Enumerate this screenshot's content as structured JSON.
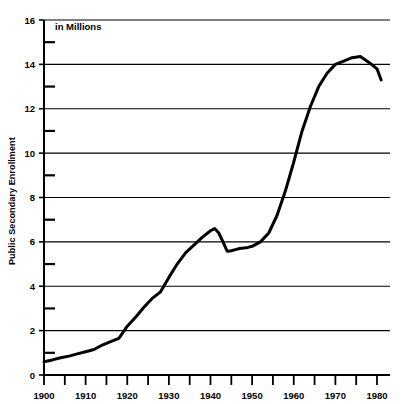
{
  "chart_data": {
    "type": "line",
    "title": "",
    "subtitle": "",
    "annotation": "in Millions",
    "xlabel": "",
    "ylabel": "Public Secondary Enrollment",
    "xlim": [
      1900,
      1981
    ],
    "ylim": [
      0,
      16
    ],
    "ytick_step": 2,
    "yminor_step": 1,
    "xtick_step": 10,
    "xminor_step": 5,
    "grid": "horizontal",
    "legend": "none",
    "line_color": "#000000",
    "line_width": 3,
    "axis_color": "#000000",
    "grid_color": "#000000",
    "background": "#ffffff",
    "xticklabels": [
      "1900",
      "1910",
      "1920",
      "1930",
      "1940",
      "1950",
      "1960",
      "1970",
      "1980"
    ],
    "yticklabels": [
      "0",
      "2",
      "4",
      "6",
      "8",
      "10",
      "12",
      "14",
      "16"
    ],
    "x": [
      1900,
      1902,
      1904,
      1906,
      1908,
      1910,
      1912,
      1914,
      1916,
      1918,
      1920,
      1922,
      1924,
      1926,
      1928,
      1930,
      1932,
      1934,
      1936,
      1938,
      1940,
      1941,
      1942,
      1943,
      1944,
      1945,
      1946,
      1947,
      1948,
      1949,
      1950,
      1952,
      1954,
      1956,
      1958,
      1960,
      1962,
      1964,
      1966,
      1968,
      1970,
      1972,
      1974,
      1976,
      1978,
      1980,
      1981
    ],
    "values": [
      0.6,
      0.68,
      0.78,
      0.85,
      0.95,
      1.05,
      1.15,
      1.35,
      1.5,
      1.65,
      2.2,
      2.6,
      3.05,
      3.45,
      3.75,
      4.4,
      5.0,
      5.5,
      5.85,
      6.2,
      6.5,
      6.6,
      6.4,
      6.0,
      5.58,
      5.6,
      5.65,
      5.7,
      5.72,
      5.75,
      5.8,
      6.0,
      6.4,
      7.2,
      8.3,
      9.6,
      11.0,
      12.1,
      13.0,
      13.6,
      14.0,
      14.15,
      14.3,
      14.35,
      14.1,
      13.8,
      13.3
    ],
    "series_name": "Public Secondary Enrollment"
  },
  "axes": {
    "y_title": "Public Secondary Enrollment",
    "note": "in Millions"
  }
}
